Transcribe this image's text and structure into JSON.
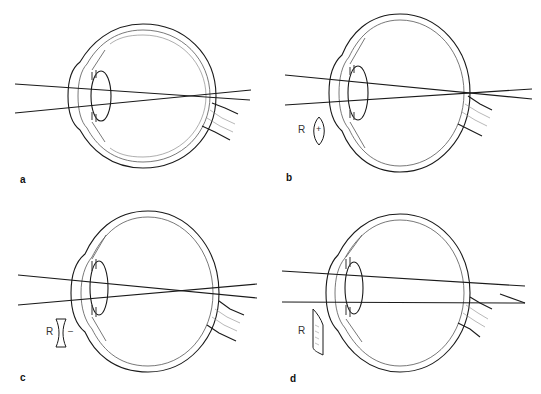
{
  "figure": {
    "panels": [
      {
        "id": "a",
        "label": "a",
        "corrective_lens": null
      },
      {
        "id": "b",
        "label": "b",
        "corrective_lens": {
          "symbol": "R",
          "sign": "+",
          "type": "convex"
        }
      },
      {
        "id": "c",
        "label": "c",
        "corrective_lens": {
          "symbol": "R",
          "sign": "–",
          "type": "concave"
        }
      },
      {
        "id": "d",
        "label": "d",
        "corrective_lens": {
          "symbol": "R",
          "sign": "",
          "type": "cylindrical"
        }
      }
    ]
  },
  "colors": {
    "line": "#1a1a1a",
    "thin_line": "#6a6a6a",
    "background": "#ffffff"
  }
}
